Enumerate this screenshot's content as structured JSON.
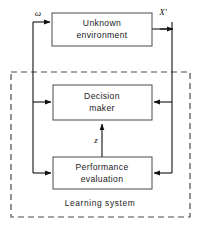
{
  "diagram": {
    "canvas": {
      "width": 203,
      "height": 236,
      "background": "#ffffff"
    },
    "blocks": [
      {
        "id": "unknown-environment",
        "label_line1": "Unknown",
        "label_line2": "environment",
        "x": 52,
        "y": 13,
        "w": 100,
        "h": 33
      },
      {
        "id": "decision-maker",
        "label_line1": "Decision",
        "label_line2": "maker",
        "x": 53,
        "y": 85,
        "w": 99,
        "h": 35
      },
      {
        "id": "performance-evaluation",
        "label_line1": "Performance",
        "label_line2": "evaluation",
        "x": 53,
        "y": 157,
        "w": 99,
        "h": 32
      }
    ],
    "boundary": {
      "id": "learning-system",
      "label": "Learning system",
      "style": "dashed",
      "x": 11,
      "y": 72,
      "w": 179,
      "h": 145
    },
    "signals": [
      {
        "id": "omega",
        "label": "ω",
        "x": 38,
        "y": 16
      },
      {
        "id": "x-prime",
        "label": "X′",
        "x": 163,
        "y": 15
      },
      {
        "id": "z",
        "label": "z",
        "x": 97,
        "y": 141
      }
    ],
    "colors": {
      "line": "#111111",
      "block_stroke": "#4a4a4a",
      "text": "#1a1a1a",
      "background": "#ffffff"
    }
  }
}
